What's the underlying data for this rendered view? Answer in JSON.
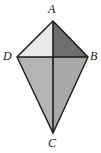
{
  "figure": {
    "name": "kite-diagram",
    "shape": "kite",
    "background_color": "#ffffff",
    "stroke_color": "#1a1a1a",
    "labels": {
      "apex_top": "A",
      "left": "D",
      "right": "B",
      "apex_bottom": "C"
    },
    "vertices": {
      "A": {
        "x": 53,
        "y": 21
      },
      "D": {
        "x": 17,
        "y": 57
      },
      "B": {
        "x": 88,
        "y": 57
      },
      "C": {
        "x": 53,
        "y": 133
      },
      "center": {
        "x": 53,
        "y": 57
      }
    },
    "diagonals": [
      {
        "name": "vertical-diagonal-AC",
        "from": "A",
        "to": "C"
      },
      {
        "name": "horizontal-diagonal-DB",
        "from": "D",
        "to": "B"
      }
    ],
    "regions": [
      {
        "name": "triangle-A-D-center",
        "fill": "#e8e8e8"
      },
      {
        "name": "triangle-A-center-B",
        "fill": "#6e6e6e"
      },
      {
        "name": "triangle-D-center-C",
        "fill": "#b4b4b4"
      },
      {
        "name": "triangle-center-B-C",
        "fill": "#a9a9a9"
      }
    ]
  }
}
